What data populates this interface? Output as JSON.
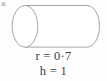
{
  "figure": {
    "type": "cylinder-diagram",
    "corner_mark": "a",
    "shape": {
      "name": "cylinder",
      "orientation": "horizontal",
      "outline_color": "#9b9b9b",
      "fill_color": "#ffffff",
      "stroke_width": 0.9
    },
    "labels": [
      {
        "id": "radius",
        "text": "r = 0·7",
        "symbol": "r",
        "value": "0·7"
      },
      {
        "id": "height",
        "text": "h = 1",
        "symbol": "h",
        "value": "1"
      }
    ]
  }
}
